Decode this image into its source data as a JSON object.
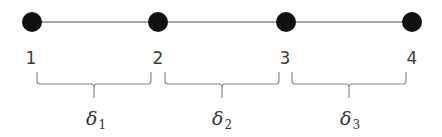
{
  "diagram": {
    "type": "1D element chain",
    "colors": {
      "node_fill": "#111111",
      "line": "#888888",
      "brace": "#8a8a8a",
      "text": "#3a3a3a"
    },
    "axis_line": {
      "y": 22,
      "x_start": 32,
      "x_end": 412
    },
    "nodes": [
      {
        "id": "1",
        "label": "1",
        "x": 32,
        "y": 22,
        "label_x": 31,
        "label_y": 58
      },
      {
        "id": "2",
        "label": "2",
        "x": 158,
        "y": 22,
        "label_x": 158,
        "label_y": 58
      },
      {
        "id": "3",
        "label": "3",
        "x": 286,
        "y": 22,
        "label_x": 285,
        "label_y": 58
      },
      {
        "id": "4",
        "label": "4",
        "x": 412,
        "y": 22,
        "label_x": 412,
        "label_y": 58
      }
    ],
    "segments": [
      {
        "symbol": "δ",
        "subscript": "1",
        "brace_x1": 37,
        "brace_x2": 151,
        "label_x": 96,
        "label_y": 120
      },
      {
        "symbol": "δ",
        "subscript": "2",
        "brace_x1": 165,
        "brace_x2": 279,
        "label_x": 222,
        "label_y": 120
      },
      {
        "symbol": "δ",
        "subscript": "3",
        "brace_x1": 292,
        "brace_x2": 406,
        "label_x": 350,
        "label_y": 120
      }
    ]
  }
}
